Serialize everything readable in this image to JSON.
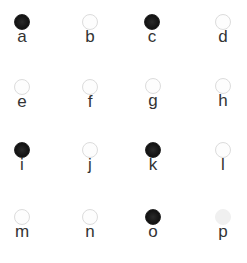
{
  "items": [
    {
      "label": "a",
      "state": "filled",
      "x": 2,
      "y": 14
    },
    {
      "label": "b",
      "state": "empty",
      "x": 70,
      "y": 14
    },
    {
      "label": "c",
      "state": "filled",
      "x": 132,
      "y": 14
    },
    {
      "label": "d",
      "state": "empty",
      "x": 203,
      "y": 14
    },
    {
      "label": "e",
      "state": "empty",
      "x": 2,
      "y": 79
    },
    {
      "label": "f",
      "state": "empty",
      "x": 70,
      "y": 79
    },
    {
      "label": "g",
      "state": "empty",
      "x": 133,
      "y": 78
    },
    {
      "label": "h",
      "state": "empty",
      "x": 203,
      "y": 78
    },
    {
      "label": "i",
      "state": "filled",
      "x": 2,
      "y": 142
    },
    {
      "label": "j",
      "state": "empty",
      "x": 70,
      "y": 142
    },
    {
      "label": "k",
      "state": "filled",
      "x": 133,
      "y": 142
    },
    {
      "label": "l",
      "state": "empty",
      "x": 203,
      "y": 142
    },
    {
      "label": "m",
      "state": "empty",
      "x": 2,
      "y": 209
    },
    {
      "label": "n",
      "state": "empty",
      "x": 70,
      "y": 209
    },
    {
      "label": "o",
      "state": "filled",
      "x": 133,
      "y": 209
    },
    {
      "label": "p",
      "state": "faint",
      "x": 203,
      "y": 209
    }
  ]
}
